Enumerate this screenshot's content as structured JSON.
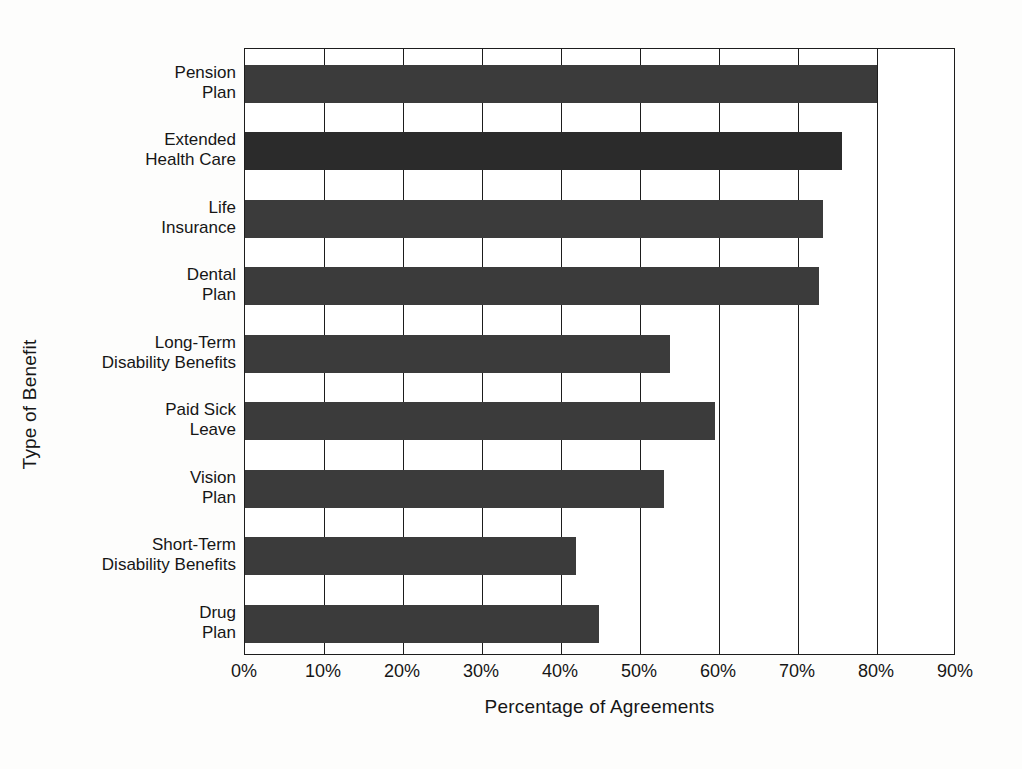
{
  "chart_data": {
    "type": "bar",
    "orientation": "horizontal",
    "title": "",
    "xlabel": "Percentage of Agreements",
    "ylabel": "Type of Benefit",
    "categories": [
      "Pension\nPlan",
      "Extended\nHealth Care",
      "Life\nInsurance",
      "Dental\nPlan",
      "Long-Term\nDisability Benefits",
      "Paid Sick\nLeave",
      "Vision\nPlan",
      "Short-Term\nDisability Benefits",
      "Drug\nPlan"
    ],
    "values": [
      80.0,
      75.6,
      73.2,
      72.7,
      53.8,
      59.5,
      53.0,
      41.9,
      44.8
    ],
    "xlim": [
      0,
      90
    ],
    "xticks": [
      0,
      10,
      20,
      30,
      40,
      50,
      60,
      70,
      80,
      90
    ],
    "xtick_labels": [
      "0%",
      "10%",
      "20%",
      "30%",
      "40%",
      "50%",
      "60%",
      "70%",
      "80%",
      "90%"
    ],
    "grid": "vertical",
    "legend": "none",
    "bar_color": "#3b3b3b",
    "bar_color_highlight": "#2b2b2b",
    "axis_color": "#1d1d1d",
    "background": "#ffffff"
  }
}
